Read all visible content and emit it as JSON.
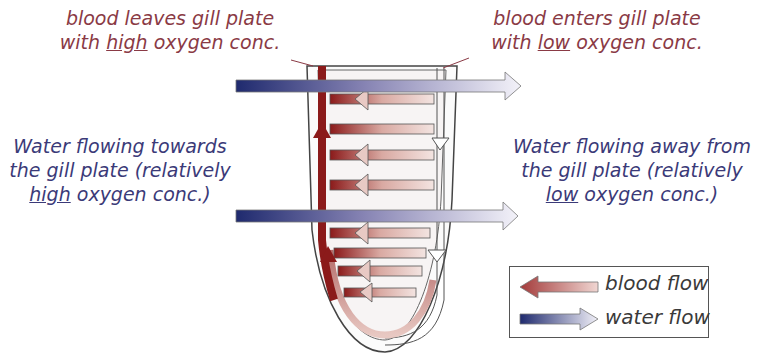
{
  "diagram": {
    "labels": {
      "blood_leaves": {
        "line1": "blood leaves gill plate",
        "line2_pre": "with ",
        "line2_emph": "high",
        "line2_post": " oxygen conc."
      },
      "blood_enters": {
        "line1": "blood enters gill plate",
        "line2_pre": "with ",
        "line2_emph": "low",
        "line2_post": " oxygen conc."
      },
      "water_towards": {
        "line1": "Water flowing towards",
        "line2": "the gill plate (relatively",
        "line3_emph": "high",
        "line3_post": " oxygen conc.)"
      },
      "water_away": {
        "line1": "Water flowing away from",
        "line2": "the gill plate (relatively",
        "line3_emph": "low",
        "line3_post": " oxygen conc.)"
      }
    },
    "legend": {
      "items": [
        {
          "label": "blood flow",
          "icon": "blood-flow-arrow-icon",
          "direction": "left"
        },
        {
          "label": "water flow",
          "icon": "water-flow-arrow-icon",
          "direction": "right"
        }
      ]
    },
    "colors": {
      "blood_dark": "#8b1a1a",
      "blood_light": "#efd8d4",
      "water_dark": "#1f2a6e",
      "water_light": "#f1f0f8",
      "blood_text": "#8a3a45",
      "water_text": "#3b3a78",
      "outline": "#444444"
    }
  }
}
